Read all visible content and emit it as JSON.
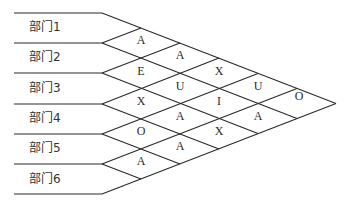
{
  "departments": [
    "部门1",
    "部门2",
    "部门3",
    "部门4",
    "部门5",
    "部门6"
  ],
  "relationships": [
    {
      "pair": [
        "部门1",
        "部门2"
      ],
      "code": "A"
    },
    {
      "pair": [
        "部门2",
        "部门3"
      ],
      "code": "E"
    },
    {
      "pair": [
        "部门3",
        "部门4"
      ],
      "code": "X"
    },
    {
      "pair": [
        "部门4",
        "部门5"
      ],
      "code": "O"
    },
    {
      "pair": [
        "部门5",
        "部门6"
      ],
      "code": "A"
    },
    {
      "pair": [
        "部门1",
        "部门3"
      ],
      "code": "A"
    },
    {
      "pair": [
        "部门2",
        "部门4"
      ],
      "code": "U"
    },
    {
      "pair": [
        "部门3",
        "部门5"
      ],
      "code": "A"
    },
    {
      "pair": [
        "部门4",
        "部门6"
      ],
      "code": "A"
    },
    {
      "pair": [
        "部门1",
        "部门4"
      ],
      "code": "X"
    },
    {
      "pair": [
        "部门2",
        "部门5"
      ],
      "code": "I"
    },
    {
      "pair": [
        "部门3",
        "部门6"
      ],
      "code": "X"
    },
    {
      "pair": [
        "部门1",
        "部门5"
      ],
      "code": "U"
    },
    {
      "pair": [
        "部门2",
        "部门6"
      ],
      "code": "A"
    },
    {
      "pair": [
        "部门1",
        "部门6"
      ],
      "code": "O"
    }
  ],
  "colors": {
    "line": "#2b2b2b",
    "text": "#333333",
    "background": "#ffffff"
  }
}
